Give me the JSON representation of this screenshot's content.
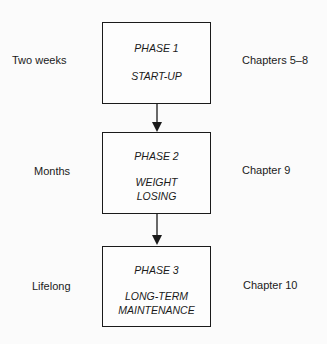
{
  "phases": [
    {
      "title": "PHASE 1",
      "name_lines": [
        "START-UP"
      ],
      "duration": "Two weeks",
      "chapters": "Chapters 5–8"
    },
    {
      "title": "PHASE 2",
      "name_lines": [
        "WEIGHT",
        "LOSING"
      ],
      "duration": "Months",
      "chapters": "Chapter 9"
    },
    {
      "title": "PHASE 3",
      "name_lines": [
        "LONG-TERM",
        "MAINTENANCE"
      ],
      "duration": "Lifelong",
      "chapters": "Chapter 10"
    }
  ]
}
